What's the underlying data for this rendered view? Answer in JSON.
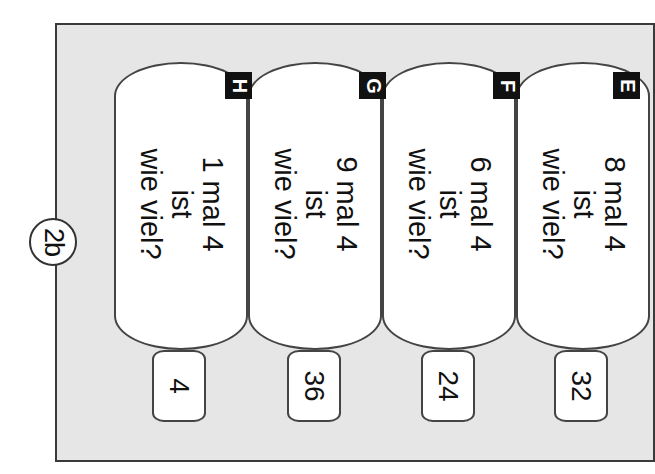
{
  "section_label": "2b",
  "cards": [
    {
      "letter": "H",
      "line1": "1 mal 4",
      "line2": "ist",
      "line3": "wie viel?",
      "answer": "4"
    },
    {
      "letter": "G",
      "line1": "9 mal 4",
      "line2": "ist",
      "line3": "wie viel?",
      "answer": "36"
    },
    {
      "letter": "F",
      "line1": "6 mal 4",
      "line2": "ist",
      "line3": "wie viel?",
      "answer": "24"
    },
    {
      "letter": "E",
      "line1": "8 mal 4",
      "line2": "ist",
      "line3": "wie viel?",
      "answer": "32"
    }
  ],
  "colors": {
    "panel": "#e6e6e6",
    "border": "#3a3a3a",
    "badge": "#111111"
  }
}
